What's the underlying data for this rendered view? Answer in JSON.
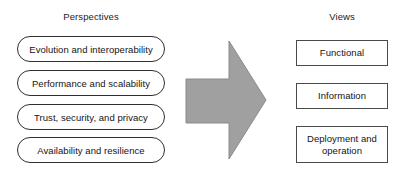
{
  "diagram": {
    "background_color": "#ffffff",
    "left_column": {
      "heading": "Perspectives",
      "items": [
        {
          "label": "Evolution and interoperability"
        },
        {
          "label": "Performance and scalability"
        },
        {
          "label": "Trust, security, and privacy"
        },
        {
          "label": "Availability and resilience"
        }
      ],
      "shape": "rounded-pill",
      "border_color": "#2e2e2e",
      "fill_color": "#ffffff"
    },
    "connector": {
      "icon": "right-arrow-icon",
      "direction": "right",
      "fill_color": "#a0a0a0",
      "stroke_color": "#8a8a8a"
    },
    "right_column": {
      "heading": "Views",
      "items": [
        {
          "label": "Functional",
          "lines": [
            "Functional"
          ]
        },
        {
          "label": "Information",
          "lines": [
            "Information"
          ]
        },
        {
          "label": "Deployment and operation",
          "lines": [
            "Deployment and",
            "operation"
          ]
        }
      ],
      "shape": "rectangle",
      "border_color": "#4a4a4a",
      "fill_color": "#ffffff"
    }
  }
}
